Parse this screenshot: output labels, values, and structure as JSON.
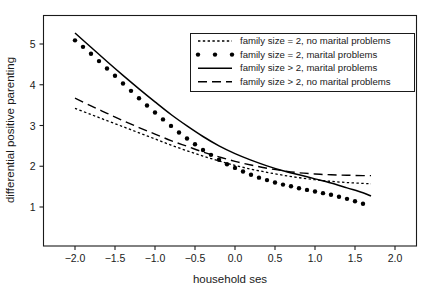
{
  "chart_data": {
    "type": "line",
    "title": "",
    "xlabel": "household ses",
    "ylabel": "differential positive parenting",
    "xlim": [
      -2.35,
      2.35
    ],
    "ylim": [
      0.58,
      5.6
    ],
    "grid": false,
    "legend_position": "top-right",
    "xticks": [
      -2.0,
      -1.5,
      -1.0,
      -0.5,
      0.0,
      0.5,
      1.0,
      1.5,
      2.0
    ],
    "xticklabels": [
      "-2.0",
      "-1.5",
      "-1.0",
      "-0.5",
      "0.0",
      "0.5",
      "1.0",
      "1.5",
      "2.0"
    ],
    "yticks": [
      1,
      2,
      3,
      4,
      5
    ],
    "yticklabels": [
      "1",
      "2",
      "3",
      "4",
      "5"
    ],
    "series": [
      {
        "name": "family size = 2, no marital problems",
        "style": "dotted-fine",
        "x": [
          -2.0,
          -1.8,
          -1.6,
          -1.4,
          -1.2,
          -1.0,
          -0.8,
          -0.6,
          -0.4,
          -0.2,
          0.0,
          0.2,
          0.4,
          0.6,
          0.8,
          1.0,
          1.2,
          1.4,
          1.6,
          1.7
        ],
        "values": [
          3.42,
          3.27,
          3.12,
          2.97,
          2.82,
          2.67,
          2.52,
          2.38,
          2.25,
          2.13,
          2.02,
          1.93,
          1.85,
          1.78,
          1.72,
          1.67,
          1.63,
          1.6,
          1.58,
          1.57
        ]
      },
      {
        "name": "family size = 2, marital problems",
        "style": "dotted-heavy",
        "x": [
          -2.0,
          -1.9,
          -1.8,
          -1.7,
          -1.6,
          -1.5,
          -1.4,
          -1.3,
          -1.2,
          -1.1,
          -1.0,
          -0.9,
          -0.8,
          -0.7,
          -0.6,
          -0.5,
          -0.4,
          -0.3,
          -0.2,
          -0.1,
          0.0,
          0.1,
          0.2,
          0.3,
          0.4,
          0.5,
          0.6,
          0.7,
          0.8,
          0.9,
          1.0,
          1.1,
          1.2,
          1.3,
          1.4,
          1.5,
          1.6
        ],
        "values": [
          5.09,
          4.93,
          4.76,
          4.58,
          4.4,
          4.22,
          4.03,
          3.85,
          3.67,
          3.49,
          3.32,
          3.15,
          2.99,
          2.83,
          2.68,
          2.54,
          2.4,
          2.28,
          2.16,
          2.05,
          1.96,
          1.87,
          1.79,
          1.72,
          1.66,
          1.6,
          1.55,
          1.51,
          1.46,
          1.42,
          1.38,
          1.34,
          1.3,
          1.25,
          1.2,
          1.14,
          1.08
        ]
      },
      {
        "name": "family size > 2, marital problems",
        "style": "solid",
        "x": [
          -2.0,
          -1.8,
          -1.6,
          -1.4,
          -1.2,
          -1.0,
          -0.8,
          -0.6,
          -0.4,
          -0.2,
          0.0,
          0.2,
          0.4,
          0.6,
          0.8,
          1.0,
          1.2,
          1.4,
          1.6,
          1.7
        ],
        "values": [
          5.27,
          4.92,
          4.57,
          4.23,
          3.9,
          3.58,
          3.27,
          2.99,
          2.73,
          2.5,
          2.31,
          2.15,
          2.01,
          1.89,
          1.79,
          1.69,
          1.59,
          1.47,
          1.35,
          1.27
        ]
      },
      {
        "name": "family size > 2, no marital problems",
        "style": "dashed-long",
        "x": [
          -2.0,
          -1.8,
          -1.6,
          -1.4,
          -1.2,
          -1.0,
          -0.8,
          -0.6,
          -0.4,
          -0.2,
          0.0,
          0.2,
          0.4,
          0.6,
          0.8,
          1.0,
          1.2,
          1.4,
          1.6,
          1.7
        ],
        "values": [
          3.67,
          3.48,
          3.3,
          3.12,
          2.95,
          2.79,
          2.63,
          2.49,
          2.35,
          2.23,
          2.12,
          2.03,
          1.95,
          1.89,
          1.84,
          1.81,
          1.79,
          1.78,
          1.77,
          1.77
        ]
      }
    ]
  },
  "legend": {
    "items": [
      {
        "label": "family size = 2, no marital problems",
        "sample": "dotted-fine"
      },
      {
        "label": "family size = 2, marital problems",
        "sample": "dotted-heavy"
      },
      {
        "label": "family size > 2, marital problems",
        "sample": "solid"
      },
      {
        "label": "family size > 2, no marital problems",
        "sample": "dashed-long"
      }
    ]
  },
  "colors": {
    "ink": "#1a1a1a",
    "curve": "#000000",
    "background": "#ffffff"
  }
}
